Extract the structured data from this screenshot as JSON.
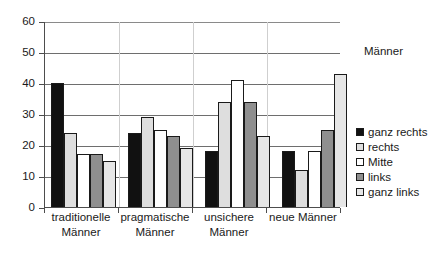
{
  "chart_data": {
    "type": "bar",
    "title": "",
    "legend_title": "Männer",
    "legend_position": "right",
    "grid": true,
    "xlabel": "",
    "ylabel": "",
    "ylim": [
      0,
      60
    ],
    "yticks": [
      0,
      10,
      20,
      30,
      40,
      50,
      60
    ],
    "ytick_labels": [
      "0",
      "10",
      "20",
      "30",
      "40",
      "50",
      "60"
    ],
    "categories": [
      "traditionelle Männer",
      "pragmatische Männer",
      "unsichere Männer",
      "neue Männer"
    ],
    "category_lines": [
      [
        "traditionelle",
        "Männer"
      ],
      [
        "pragmatische",
        "Männer"
      ],
      [
        "unsichere",
        "Männer"
      ],
      [
        "neue Männer",
        ""
      ]
    ],
    "series": [
      {
        "name": "ganz rechts",
        "color": "#111111",
        "values": [
          40,
          24,
          18,
          18
        ]
      },
      {
        "name": "rechts",
        "color": "#dedede",
        "values": [
          24,
          29,
          34,
          12
        ]
      },
      {
        "name": "Mitte",
        "color": "#ffffff",
        "values": [
          17,
          25,
          41,
          18
        ]
      },
      {
        "name": "links",
        "color": "#8f8f8f",
        "values": [
          17,
          23,
          34,
          25
        ]
      },
      {
        "name": "ganz links",
        "color": "#e6e6e6",
        "values": [
          15,
          19,
          23,
          43
        ]
      }
    ]
  }
}
